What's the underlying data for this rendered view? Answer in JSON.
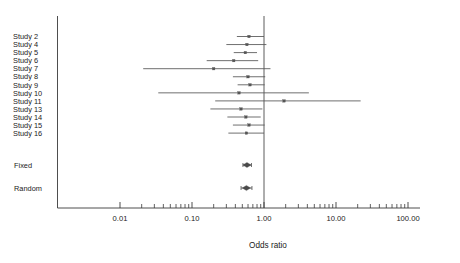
{
  "chart_data": {
    "type": "forest",
    "title": "",
    "xlabel": "Odds ratio",
    "ylabel": "",
    "xscale": "log",
    "xlim": [
      0.01,
      100.0
    ],
    "grid": false,
    "reference_line": 1.0,
    "tick_labels": [
      "0.01",
      "0.10",
      "1.00",
      "10.00",
      "100.00"
    ],
    "tick_values": [
      0.01,
      0.1,
      1.0,
      10.0,
      100.0
    ],
    "columns": [
      "Study",
      "Odds ratio",
      "Lower CI",
      "Upper CI"
    ],
    "rows": [
      {
        "label": "Study  2",
        "or": 0.62,
        "lo": 0.42,
        "hi": 1.0,
        "kind": "study"
      },
      {
        "label": "Study  4",
        "or": 0.58,
        "lo": 0.3,
        "hi": 1.08,
        "kind": "study"
      },
      {
        "label": "Study  5",
        "or": 0.55,
        "lo": 0.38,
        "hi": 0.8,
        "kind": "study"
      },
      {
        "label": "Study  6",
        "or": 0.38,
        "lo": 0.16,
        "hi": 0.83,
        "kind": "study"
      },
      {
        "label": "Study  7",
        "or": 0.2,
        "lo": 0.021,
        "hi": 1.23,
        "kind": "study"
      },
      {
        "label": "Study  8",
        "or": 0.6,
        "lo": 0.37,
        "hi": 1.04,
        "kind": "study"
      },
      {
        "label": "Study  9",
        "or": 0.64,
        "lo": 0.43,
        "hi": 1.02,
        "kind": "study"
      },
      {
        "label": "Study 10",
        "or": 0.45,
        "lo": 0.034,
        "hi": 4.2,
        "kind": "study"
      },
      {
        "label": "Study 11",
        "or": 1.9,
        "lo": 0.21,
        "hi": 22.0,
        "kind": "study"
      },
      {
        "label": "Study 13",
        "or": 0.48,
        "lo": 0.18,
        "hi": 0.95,
        "kind": "study"
      },
      {
        "label": "Study 14",
        "or": 0.56,
        "lo": 0.31,
        "hi": 0.9,
        "kind": "study"
      },
      {
        "label": "Study 15",
        "or": 0.62,
        "lo": 0.37,
        "hi": 1.02,
        "kind": "study"
      },
      {
        "label": "Study 16",
        "or": 0.57,
        "lo": 0.32,
        "hi": 1.0,
        "kind": "study"
      },
      {
        "label": "Fixed",
        "or": 0.58,
        "lo": 0.51,
        "hi": 0.67,
        "kind": "summary"
      },
      {
        "label": "Random",
        "or": 0.57,
        "lo": 0.48,
        "hi": 0.68,
        "kind": "summary"
      }
    ]
  },
  "axis": {
    "title": "Odds ratio"
  },
  "colors": {
    "line": "#3a3a3a",
    "marker": "#555555",
    "reference": "#4a4a4a",
    "background": "#ffffff"
  }
}
